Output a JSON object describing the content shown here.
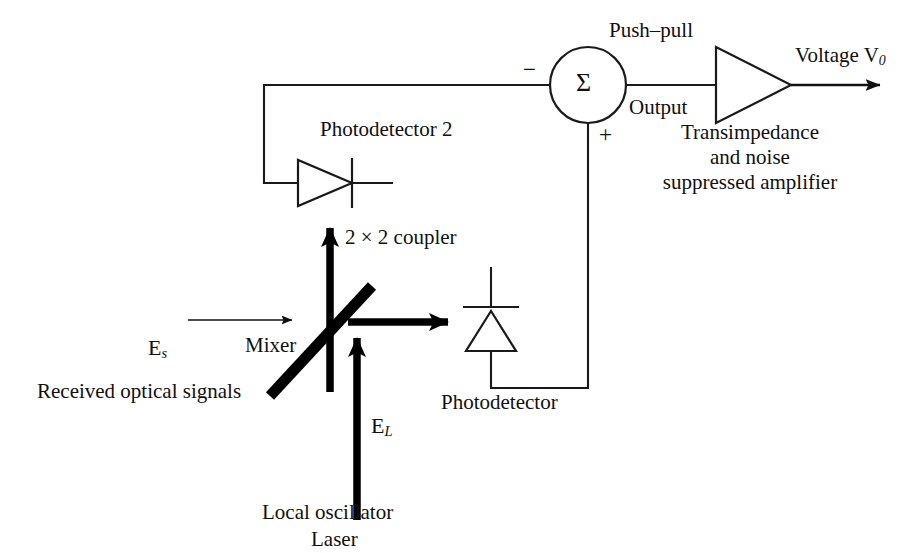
{
  "figure": {
    "width": 924,
    "height": 553,
    "background": "#ffffff",
    "line_color": "#1a1a1a",
    "optical_beam_color": "#000000",
    "text_color": "#101010"
  },
  "labels": {
    "push_pull": "Push–pull",
    "output": "Output",
    "sigma": "Σ",
    "minus_sign": "−",
    "plus_sign": "+",
    "voltage_out": "Voltage",
    "voltage_symbol": "V",
    "voltage_subscript": "0",
    "amplifier_line1": "Transimpedance",
    "amplifier_line2": "and noise",
    "amplifier_line3": "suppressed amplifier",
    "photodetector_2": "Photodetector 2",
    "photodetector_1": "Photodetector",
    "coupler": "2 × 2 coupler",
    "mixer": "Mixer",
    "received_signals": "Received optical signals",
    "signal_field_symbol": "E",
    "signal_field_subscript": "s",
    "lo_field_symbol": "E",
    "lo_field_subscript": "L",
    "local_oscillator": "Local oscillator",
    "laser": "Laser"
  },
  "geometry": {
    "summing_node": {
      "cx": 588,
      "cy": 85,
      "r": 38
    },
    "amplifier_triangle": {
      "x1": 716,
      "y1": 47,
      "x2": 716,
      "y2": 123,
      "apex_x": 791,
      "apex_y": 85
    },
    "output_arrow_end_x": 886,
    "feedback_corner": {
      "x": 264,
      "y": 85,
      "down_to_y": 183
    },
    "plus_path": {
      "x": 588,
      "from_y": 123,
      "to_y": 388,
      "left_to_x": 491
    },
    "photodetector2": {
      "tri_left": 298,
      "tri_top": 160,
      "tri_bottom": 206,
      "apex_x": 352,
      "bar_x": 352,
      "lead_right_x": 392
    },
    "photodetector1": {
      "tri_left": 466,
      "tri_right": 516,
      "tri_base_y": 351,
      "apex_y": 311,
      "bar_y": 307,
      "lead_top_y": 268,
      "lead_bottom_y": 388
    },
    "mixer_bar": {
      "x1": 270,
      "y1": 396,
      "x2": 372,
      "y2": 286,
      "width": 11
    },
    "coupler_arrow": {
      "x": 330,
      "from_y": 392,
      "to_y": 213
    },
    "lo_arrow": {
      "x": 357,
      "from_y": 520,
      "to_y": 325
    },
    "signal_arrow": {
      "from_x": 188,
      "to_x": 298,
      "y": 320
    },
    "mixer_out_arrow": {
      "from_x": 348,
      "to_x": 462,
      "y": 322
    }
  }
}
